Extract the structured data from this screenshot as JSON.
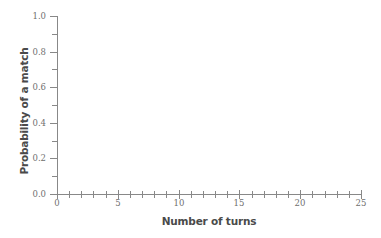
{
  "chart_data": {
    "type": "line",
    "title": "",
    "subtitle": "",
    "xlabel": "Number of turns",
    "ylabel": "Probability of a match",
    "xlim": [
      0,
      25
    ],
    "ylim": [
      0.0,
      1.0
    ],
    "grid": false,
    "legend": null,
    "series": [],
    "annotations": [],
    "note": "Empty axes template: no data series are plotted in the figure.",
    "x_major_ticks": [
      0,
      5,
      10,
      15,
      20,
      25
    ],
    "x_major_tick_labels": [
      "0",
      "5",
      "10",
      "15",
      "20",
      "25"
    ],
    "x_minor_ticks": [
      1,
      2,
      3,
      4,
      6,
      7,
      8,
      9,
      11,
      12,
      13,
      14,
      16,
      17,
      18,
      19,
      21,
      22,
      23,
      24
    ],
    "y_major_ticks": [
      0.0,
      0.2,
      0.4,
      0.6,
      0.8,
      1.0
    ],
    "y_major_tick_labels": [
      "0.0",
      "0.2",
      "0.4",
      "0.6",
      "0.8",
      "1.0"
    ],
    "y_minor_ticks": [
      0.1,
      0.3,
      0.5,
      0.7,
      0.9
    ]
  },
  "colors": {
    "background": "#ffffff",
    "axis": "#888888",
    "tick_label": "#6f6f6f",
    "axis_title": "#4a4a4a"
  }
}
